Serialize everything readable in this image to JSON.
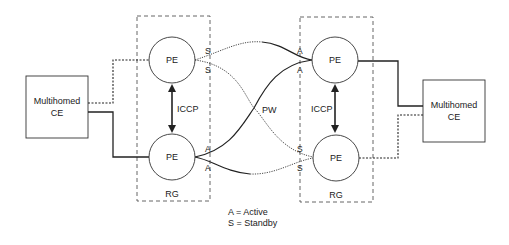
{
  "diagram": {
    "redundancy_groups": [
      {
        "label": "RG",
        "pe_top": {
          "label": "PE"
        },
        "pe_bottom": {
          "label": "PE"
        },
        "iccp_label": "ICCP"
      },
      {
        "label": "RG",
        "pe_top": {
          "label": "PE"
        },
        "pe_bottom": {
          "label": "PE"
        },
        "iccp_label": "ICCP"
      }
    ],
    "ce_left": {
      "line1": "Multihomed",
      "line2": "CE"
    },
    "ce_right": {
      "line1": "Multihomed",
      "line2": "CE"
    },
    "pw_label": "PW",
    "endpoint_labels": {
      "left_top_upper": "S",
      "left_top_lower": "S",
      "left_bottom_upper": "A",
      "left_bottom_lower": "A",
      "right_top_upper": "A",
      "right_top_lower": "A",
      "right_bottom_upper": "S",
      "right_bottom_lower": "S"
    },
    "legend": [
      "A = Active",
      "S = Standby"
    ],
    "colors": {
      "line": "#222222",
      "box_dash": "#555555"
    }
  }
}
